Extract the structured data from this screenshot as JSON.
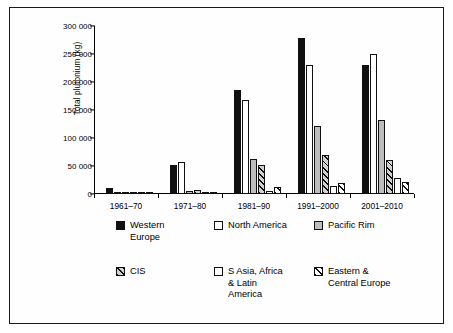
{
  "chart_data": {
    "type": "bar",
    "title": "",
    "xlabel": "",
    "ylabel": "Total plutonium (kg)",
    "ylim": [
      0,
      300000
    ],
    "ytick_values": [
      0,
      50000,
      100000,
      150000,
      200000,
      250000,
      300000
    ],
    "ytick_labels": [
      "0",
      "50 000",
      "100 000",
      "150 000",
      "200 000",
      "250 000",
      "300 000"
    ],
    "grid": false,
    "legend_position": "bottom",
    "categories": [
      "1961–70",
      "1971–80",
      "1981–90",
      "1991–2000",
      "2001–2010"
    ],
    "series": [
      {
        "name": "Western Europe",
        "pattern": "solid-black",
        "values": [
          10000,
          52000,
          185000,
          279000,
          231000
        ]
      },
      {
        "name": "North America",
        "pattern": "white-outline",
        "values": [
          1000,
          57000,
          167000,
          231000,
          250000
        ]
      },
      {
        "name": "Pacific Rim",
        "pattern": "light-gray",
        "values": [
          500,
          5000,
          63000,
          121000,
          132000
        ]
      },
      {
        "name": "CIS",
        "pattern": "hatch-gray",
        "values": [
          400,
          8000,
          51000,
          69000,
          61000
        ]
      },
      {
        "name": "S Asia, Africa & Latin America",
        "pattern": "white-outline",
        "values": [
          300,
          1000,
          5000,
          15000,
          28000
        ]
      },
      {
        "name": "Eastern & Central Europe",
        "pattern": "hatch-white",
        "values": [
          200,
          800,
          12000,
          19000,
          21000
        ]
      }
    ]
  },
  "legend": {
    "row1": [
      {
        "label": "Western\nEurope",
        "pattern": "solid-black"
      },
      {
        "label": "North America",
        "pattern": "white-outline"
      },
      {
        "label": "Pacific Rim",
        "pattern": "light-gray"
      }
    ],
    "row2": [
      {
        "label": "CIS",
        "pattern": "hatch-gray"
      },
      {
        "label": "S Asia, Africa\n& Latin\nAmerica",
        "pattern": "white-outline"
      },
      {
        "label": "Eastern &\nCentral Europe",
        "pattern": "hatch-white"
      }
    ]
  },
  "colors": {
    "axis": "#111111",
    "solid_black": "#111111",
    "light_gray": "#bdbdbd",
    "hatch_gray_fill": "#d2d2d2",
    "white_fill": "#ffffff",
    "frame": "#1a1a1a"
  }
}
